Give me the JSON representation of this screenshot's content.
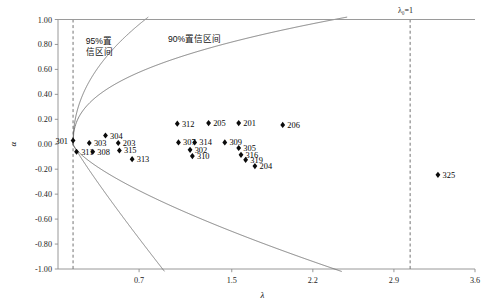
{
  "chart_data": {
    "type": "scatter",
    "title": "",
    "xlabel": "λ",
    "ylabel": "α",
    "xlim": [
      0.0,
      3.6
    ],
    "ylim": [
      -1.0,
      1.0
    ],
    "xticks": [
      "0.7",
      "1.5",
      "2.2",
      "2.9",
      "3.6"
    ],
    "xtick_values": [
      0.7,
      1.5,
      2.2,
      2.9,
      3.6
    ],
    "yticks": [
      "1.00",
      "0.80",
      "0.60",
      "0.40",
      "0.20",
      "0.00",
      "-0.20",
      "-0.40",
      "-0.60",
      "-0.80",
      "-1.00"
    ],
    "ytick_values": [
      1.0,
      0.8,
      0.6,
      0.4,
      0.2,
      0.0,
      -0.2,
      -0.4,
      -0.6,
      -0.8,
      -1.0
    ],
    "grid": false,
    "legend": "none",
    "annotations": [
      {
        "name": "ci95-label",
        "text_lines": [
          "95%置",
          "信区间"
        ],
        "x": 0.24,
        "y": 0.8
      },
      {
        "name": "ci90-label",
        "text_lines": [
          "90%置信区间"
        ],
        "x": 0.95,
        "y": 0.82
      },
      {
        "name": "lambda0-label",
        "text_lines": [
          "λ₀=1"
        ],
        "x": 3.0,
        "y": 1.05
      }
    ],
    "reference_lines": [
      {
        "name": "lambda0-left-dashed",
        "orientation": "vertical",
        "value": 0.13,
        "style": "dashed"
      },
      {
        "name": "lambda0-right-dashed",
        "orientation": "vertical",
        "value": 3.04,
        "style": "dashed"
      },
      {
        "name": "top-boundary",
        "orientation": "horizontal",
        "value": 1.0,
        "style": "solid"
      }
    ],
    "curves": [
      {
        "name": "ci95-upper",
        "label": "95% confidence upper bound"
      },
      {
        "name": "ci95-lower",
        "label": "95% confidence lower bound"
      },
      {
        "name": "ci90-upper",
        "label": "90% confidence upper bound"
      },
      {
        "name": "ci90-lower",
        "label": "90% confidence lower bound"
      }
    ],
    "points": [
      {
        "label": "301",
        "x": 0.13,
        "y": 0.03,
        "label_pos": "left"
      },
      {
        "label": "303",
        "x": 0.27,
        "y": 0.01,
        "label_pos": "right"
      },
      {
        "label": "304",
        "x": 0.41,
        "y": 0.07,
        "label_pos": "right"
      },
      {
        "label": "203",
        "x": 0.52,
        "y": 0.01,
        "label_pos": "right"
      },
      {
        "label": "311",
        "x": 0.16,
        "y": -0.06,
        "label_pos": "right"
      },
      {
        "label": "308",
        "x": 0.3,
        "y": -0.06,
        "label_pos": "right"
      },
      {
        "label": "315",
        "x": 0.53,
        "y": -0.05,
        "label_pos": "right"
      },
      {
        "label": "313",
        "x": 0.64,
        "y": -0.12,
        "label_pos": "right"
      },
      {
        "label": "312",
        "x": 1.03,
        "y": 0.165,
        "label_pos": "right"
      },
      {
        "label": "307",
        "x": 1.04,
        "y": 0.015,
        "label_pos": "right"
      },
      {
        "label": "314",
        "x": 1.18,
        "y": 0.015,
        "label_pos": "right"
      },
      {
        "label": "302",
        "x": 1.14,
        "y": -0.045,
        "label_pos": "right"
      },
      {
        "label": "310",
        "x": 1.16,
        "y": -0.095,
        "label_pos": "right"
      },
      {
        "label": "205",
        "x": 1.3,
        "y": 0.17,
        "label_pos": "right"
      },
      {
        "label": "201",
        "x": 1.56,
        "y": 0.17,
        "label_pos": "right"
      },
      {
        "label": "309",
        "x": 1.44,
        "y": 0.015,
        "label_pos": "right"
      },
      {
        "label": "305",
        "x": 1.56,
        "y": -0.03,
        "label_pos": "right"
      },
      {
        "label": "316",
        "x": 1.58,
        "y": -0.085,
        "label_pos": "right"
      },
      {
        "label": "319",
        "x": 1.62,
        "y": -0.125,
        "label_pos": "right"
      },
      {
        "label": "204",
        "x": 1.7,
        "y": -0.175,
        "label_pos": "right"
      },
      {
        "label": "206",
        "x": 1.94,
        "y": 0.155,
        "label_pos": "right"
      },
      {
        "label": "325",
        "x": 3.28,
        "y": -0.245,
        "label_pos": "right"
      }
    ]
  }
}
